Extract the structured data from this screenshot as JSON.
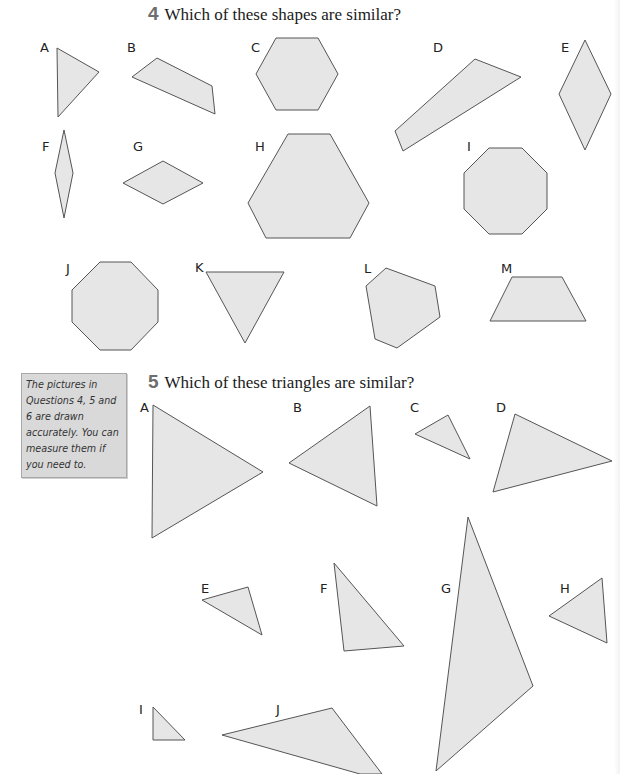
{
  "question4": {
    "number": "4",
    "text": "Which of these shapes are similar?",
    "shapes": [
      {
        "label": "A",
        "type": "triangle",
        "points": "57,48 99,72 58,117"
      },
      {
        "label": "B",
        "type": "quadrilateral",
        "points": "132,77 157,58 212,86 215,114"
      },
      {
        "label": "C",
        "type": "hexagon",
        "points": "276,38 318,38 338,74 318,110 276,110 256,74"
      },
      {
        "label": "D",
        "type": "quadrilateral",
        "points": "395,131 475,59 521,77 403,151"
      },
      {
        "label": "E",
        "type": "rhombus",
        "points": "585,40 611,94 585,150 559,94"
      },
      {
        "label": "F",
        "type": "rhombus",
        "points": "64,130 73,173 64,218 55,173"
      },
      {
        "label": "G",
        "type": "rhombus",
        "points": "163,161 203,183 163,204 123,183"
      },
      {
        "label": "H",
        "type": "hexagon",
        "points": "288,134 330,134 369,203 350,238 266,238 248,203"
      },
      {
        "label": "I",
        "type": "octagon",
        "points": "489,148 522,148 547,173 547,209 522,234 489,234 464,209 464,173"
      },
      {
        "label": "J",
        "type": "octagon",
        "points": "100,262 131,262 158,290 158,322 131,350 100,350 72,322 72,290"
      },
      {
        "label": "K",
        "type": "triangle",
        "points": "206,272 284,272 245,343"
      },
      {
        "label": "L",
        "type": "pentagon",
        "points": "386,268 435,286 440,317 397,348 375,339 366,286"
      },
      {
        "label": "M",
        "type": "trapezium",
        "points": "512,277 562,277 586,321 490,321"
      }
    ]
  },
  "question5": {
    "number": "5",
    "text": "Which of these triangles are similar?",
    "triangles": [
      {
        "label": "A",
        "points": "153,405 263,472 152,538"
      },
      {
        "label": "B",
        "points": "289,463 370,406 377,506"
      },
      {
        "label": "C",
        "points": "415,434 448,415 470,459"
      },
      {
        "label": "D",
        "points": "515,414 612,461 493,492"
      },
      {
        "label": "E",
        "points": "202,600 248,587 262,635"
      },
      {
        "label": "F",
        "points": "334,563 404,646 344,651"
      },
      {
        "label": "G",
        "points": "468,517 533,686 436,771"
      },
      {
        "label": "H",
        "points": "549,616 602,578 607,643"
      },
      {
        "label": "I",
        "points": "153,707 185,740 153,740"
      },
      {
        "label": "J",
        "points": "222,735 332,708 382,774 360,774"
      }
    ]
  },
  "note": {
    "text": "The pictures in Questions 4, 5 and 6 are drawn accurately. You can measure them if you need to."
  },
  "colors": {
    "shape_fill": "#e6e6e6",
    "shape_stroke": "#555555",
    "note_background": "#d9d9d9",
    "question_number": "#6e6e6e"
  }
}
